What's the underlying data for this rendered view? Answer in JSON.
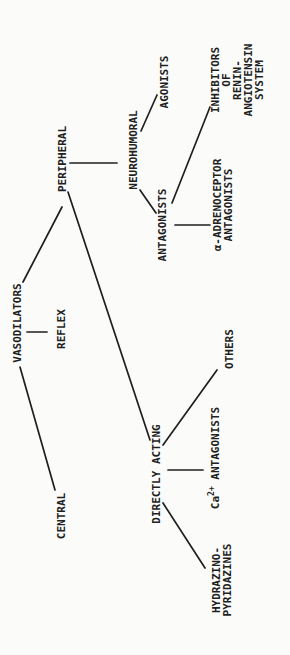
{
  "colors": {
    "ink": "#1f1f1f",
    "paper": "#fbfbfa"
  },
  "tree": {
    "nodes": {
      "vasodilators": {
        "label": "VASODILATORS"
      },
      "central": {
        "label": "CENTRAL"
      },
      "reflex": {
        "label": "REFLEX"
      },
      "peripheral": {
        "label": "PERIPHERAL"
      },
      "neurohumoral": {
        "label": "NEUROHUMORAL"
      },
      "agonists": {
        "label": "AGONISTS"
      },
      "antagonists": {
        "label": "ANTAGONISTS"
      },
      "directly_acting": {
        "label": "DIRECTLY ACTING"
      },
      "hydrazino_pyridazines": {
        "label": "HYDRAZINO-\nPYRIDAZINES"
      },
      "ca_antagonists": {
        "base": "Ca",
        "sup": "2+",
        "rest": " ANTAGONISTS"
      },
      "others": {
        "label": "OTHERS"
      },
      "alpha_adrenoceptor_antagonists": {
        "label": "α-ADRENOCEPTOR\nANTAGONISTS"
      },
      "inhibitors_ras": {
        "label": "INHIBITORS\nOF\nRENIN-\nANGIOTENSIN\nSYSTEM"
      }
    },
    "edges": [
      {
        "from": "VASODILATORS",
        "to": "CENTRAL"
      },
      {
        "from": "VASODILATORS",
        "to": "REFLEX"
      },
      {
        "from": "VASODILATORS",
        "to": "PERIPHERAL"
      },
      {
        "from": "PERIPHERAL",
        "to": "NEUROHUMORAL"
      },
      {
        "from": "PERIPHERAL",
        "to": "DIRECTLY ACTING"
      },
      {
        "from": "NEUROHUMORAL",
        "to": "AGONISTS"
      },
      {
        "from": "NEUROHUMORAL",
        "to": "ANTAGONISTS"
      },
      {
        "from": "ANTAGONISTS",
        "to": "α-ADRENOCEPTOR ANTAGONISTS"
      },
      {
        "from": "ANTAGONISTS",
        "to": "INHIBITORS OF RENIN-ANGIOTENSIN SYSTEM"
      },
      {
        "from": "DIRECTLY ACTING",
        "to": "HYDRAZINO-PYRIDAZINES"
      },
      {
        "from": "DIRECTLY ACTING",
        "to": "Ca2+ ANTAGONISTS"
      },
      {
        "from": "DIRECTLY ACTING",
        "to": "OTHERS"
      }
    ]
  }
}
